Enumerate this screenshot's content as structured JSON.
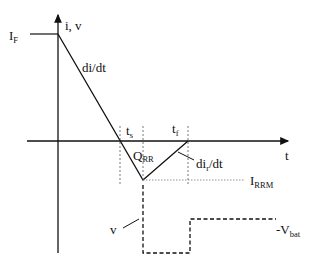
{
  "diagram": {
    "axes": {
      "y_label": "i, v",
      "x_label": "t"
    },
    "labels": {
      "forward_current": {
        "main": "I",
        "sub": "F"
      },
      "fall_slope": "di/dt",
      "storage_time": {
        "main": "t",
        "sub": "s"
      },
      "fall_time": {
        "main": "t",
        "sub": "f"
      },
      "recovered_charge": {
        "main": "Q",
        "sub": "RR"
      },
      "recovery_slope": {
        "main": "di",
        "sub": "r",
        "rest": "/dt"
      },
      "peak_reverse_current": {
        "main": "I",
        "sub": "RRM"
      },
      "voltage": "v",
      "battery_voltage": {
        "main": "-V",
        "sub": "bat"
      }
    },
    "colors": {
      "line": "#111111",
      "guide": "#555555",
      "background": "#ffffff"
    }
  }
}
